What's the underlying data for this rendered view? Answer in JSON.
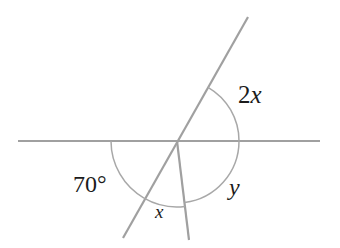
{
  "figure": {
    "kind": "geometry-diagram",
    "background_color": "#ffffff",
    "line_color": "#a0a0a0",
    "arc_color": "#a8a8a8",
    "text_color": "#1b1b1b",
    "width": 340,
    "height": 248,
    "vertex": {
      "x": 177,
      "y": 141
    },
    "lines": [
      {
        "name": "horizontal-line",
        "x1": 18,
        "y1": 141,
        "x2": 320,
        "y2": 141,
        "stroke_width": 2.2
      },
      {
        "name": "oblique-line",
        "x1": 248,
        "y1": 17,
        "x2": 123,
        "y2": 238,
        "stroke_width": 2.2
      },
      {
        "name": "vertical-ray",
        "x1": 177,
        "y1": 141,
        "x2": 189,
        "y2": 240,
        "stroke_width": 2.2
      }
    ],
    "arcs": [
      {
        "name": "arc-2x",
        "radius": 62,
        "start_angle_deg": 60,
        "end_angle_deg": 0,
        "path": "M 208.0 87.3 A 62 62 0 0 1 239.0 141.0"
      },
      {
        "name": "arc-70",
        "radius": 66,
        "start_angle_deg": 180,
        "end_angle_deg": 240,
        "path": "M 111.0 141.0 A 66 66 0 0 0 144.0 198.1"
      },
      {
        "name": "arc-y",
        "radius": 62,
        "start_angle_deg": 0,
        "end_angle_deg": -83,
        "path": "M 239.0 141.0 A 62 62 0 0 1 184.6 202.5"
      },
      {
        "name": "arc-x",
        "radius": 66,
        "start_angle_deg": 240,
        "end_angle_deg": 277,
        "path": "M 144.0 198.1 A 66 66 0 0 0 185.0 206.4"
      }
    ],
    "labels": {
      "angle_2x": {
        "coefficient": "2",
        "variable": "x"
      },
      "angle_70": {
        "value": "70",
        "degree_symbol": "°"
      },
      "angle_y": {
        "variable": "y"
      },
      "angle_x": {
        "variable": "x"
      }
    }
  }
}
